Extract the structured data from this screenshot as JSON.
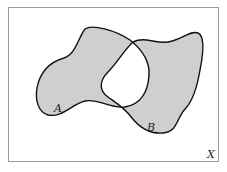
{
  "diagram": {
    "type": "venn-symmetric-difference",
    "universe_label": "X",
    "sets": [
      {
        "name": "A",
        "label": "A"
      },
      {
        "name": "B",
        "label": "B"
      }
    ],
    "shaded_region": "A △ B (symmetric difference)",
    "colors": {
      "fill": "#cfcfcf",
      "stroke": "#111111",
      "frame": "#9a9a9a",
      "background": "#ffffff"
    }
  }
}
